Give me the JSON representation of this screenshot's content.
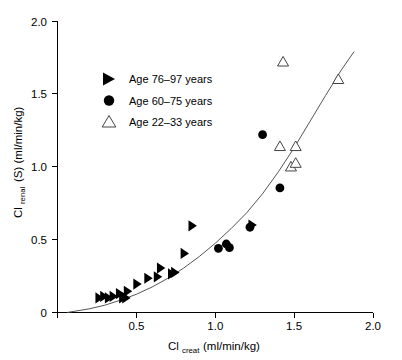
{
  "chart_data": {
    "type": "scatter",
    "title": "",
    "xlabel": "Cl_creat (ml/min/kg)",
    "xlabel_main": "Cl",
    "xlabel_sub": "creat",
    "xlabel_units": " (ml/min/kg)",
    "ylabel": "Cl_renal (S) (ml/min/kg)",
    "ylabel_main": "Cl",
    "ylabel_sub": "renal",
    "ylabel_units": " (S) (ml/min/kg)",
    "xlim": [
      0.0,
      2.0
    ],
    "ylim": [
      0.0,
      2.0
    ],
    "xticks": [
      "0",
      "0.5",
      "1.0",
      "1.5",
      "2.0"
    ],
    "xtick_values": [
      0.0,
      0.5,
      1.0,
      1.5,
      2.0
    ],
    "yticks": [
      "0",
      "0.5",
      "1.0",
      "1.5",
      "2.0"
    ],
    "ytick_values": [
      0.0,
      0.5,
      1.0,
      1.5,
      2.0
    ],
    "grid": false,
    "legend_position": "upper-left",
    "series": [
      {
        "name": "Age 76–97 years",
        "marker": "right-triangle-filled",
        "color": "#000000",
        "points": [
          [
            0.26,
            0.1
          ],
          [
            0.29,
            0.11
          ],
          [
            0.32,
            0.1
          ],
          [
            0.35,
            0.11
          ],
          [
            0.39,
            0.13
          ],
          [
            0.41,
            0.1
          ],
          [
            0.43,
            0.1
          ],
          [
            0.44,
            0.145
          ],
          [
            0.5,
            0.195
          ],
          [
            0.57,
            0.235
          ],
          [
            0.63,
            0.245
          ],
          [
            0.65,
            0.305
          ],
          [
            0.72,
            0.265
          ],
          [
            0.74,
            0.275
          ],
          [
            0.8,
            0.405
          ],
          [
            0.85,
            0.595
          ],
          [
            1.23,
            0.6
          ]
        ]
      },
      {
        "name": "Age 60–75 years",
        "marker": "circle-filled",
        "color": "#000000",
        "points": [
          [
            1.02,
            0.44
          ],
          [
            1.07,
            0.47
          ],
          [
            1.09,
            0.445
          ],
          [
            1.22,
            0.585
          ],
          [
            1.3,
            1.22
          ],
          [
            1.41,
            0.855
          ]
        ]
      },
      {
        "name": "Age 22–33 years",
        "marker": "triangle-open",
        "color": "#444444",
        "points": [
          [
            1.43,
            1.72
          ],
          [
            1.41,
            1.14
          ],
          [
            1.51,
            1.14
          ],
          [
            1.48,
            1.0
          ],
          [
            1.51,
            1.025
          ],
          [
            1.78,
            1.6
          ]
        ]
      }
    ],
    "fit_curve": {
      "name": "fitted regression curve",
      "description": "monotonic increasing curve through the data",
      "points": [
        [
          0.06,
          0.0
        ],
        [
          0.2,
          0.025
        ],
        [
          0.3,
          0.05
        ],
        [
          0.4,
          0.085
        ],
        [
          0.5,
          0.125
        ],
        [
          0.6,
          0.175
        ],
        [
          0.7,
          0.235
        ],
        [
          0.8,
          0.305
        ],
        [
          0.9,
          0.385
        ],
        [
          1.0,
          0.475
        ],
        [
          1.1,
          0.575
        ],
        [
          1.2,
          0.685
        ],
        [
          1.3,
          0.815
        ],
        [
          1.4,
          0.965
        ],
        [
          1.5,
          1.13
        ],
        [
          1.6,
          1.31
        ],
        [
          1.7,
          1.49
        ],
        [
          1.8,
          1.665
        ],
        [
          1.88,
          1.79
        ]
      ]
    }
  },
  "legend": {
    "items": [
      {
        "label": "Age 76–97 years",
        "marker": "right-triangle-filled"
      },
      {
        "label": "Age 60–75 years",
        "marker": "circle-filled"
      },
      {
        "label": "Age 22–33 years",
        "marker": "triangle-open"
      }
    ]
  },
  "axes": {
    "x": {
      "labels": [
        "0",
        "0.5",
        "1.0",
        "1.5",
        "2.0"
      ]
    },
    "y": {
      "labels": [
        "0",
        "0.5",
        "1.0",
        "1.5",
        "2.0"
      ]
    }
  }
}
